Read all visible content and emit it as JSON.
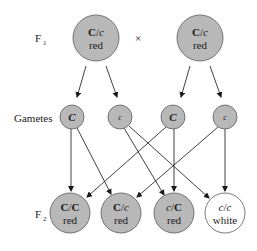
{
  "labels": {
    "f1": "F",
    "f1_sub": "1",
    "cross": "×",
    "gametes": "Gametes",
    "f2": "F",
    "f2_sub": "2"
  },
  "colors": {
    "filled": "#b8b8b8",
    "white": "#ffffff",
    "stroke": "#5a5a5a",
    "line": "#2a2a2a"
  },
  "f1": [
    {
      "allele1": "C",
      "sep": "/",
      "allele2": "c",
      "phenotype": "red"
    },
    {
      "allele1": "C",
      "sep": "/",
      "allele2": "c",
      "phenotype": "red"
    }
  ],
  "gametes": [
    {
      "allele": "C"
    },
    {
      "allele": "c"
    },
    {
      "allele": "C"
    },
    {
      "allele": "c"
    }
  ],
  "f2": [
    {
      "allele1": "C",
      "sep": "/",
      "allele2": "C",
      "phenotype": "red"
    },
    {
      "allele1": "C",
      "sep": "/",
      "allele2": "c",
      "phenotype": "red"
    },
    {
      "allele1": "c",
      "sep": "/",
      "allele2": "C",
      "phenotype": "red"
    },
    {
      "allele1": "c",
      "sep": "/",
      "allele2": "c",
      "phenotype": "white"
    }
  ]
}
